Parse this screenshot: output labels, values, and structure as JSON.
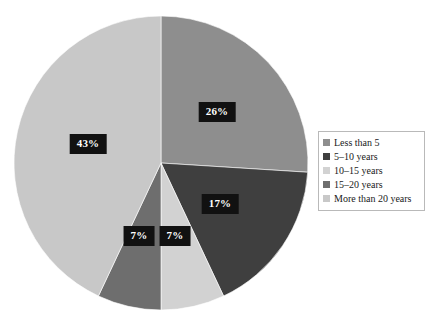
{
  "chart_data": {
    "type": "pie",
    "title": "",
    "subtitle": "",
    "categories": [
      "Less than 5",
      "5–10 years",
      "10–15 years",
      "15–20 years",
      "More than 20 years"
    ],
    "values": [
      26,
      17,
      7,
      7,
      43
    ],
    "value_labels": [
      "26%",
      "17%",
      "7%",
      "7%",
      "43%"
    ],
    "unit": "%",
    "total": 100,
    "start_angle_deg": 0,
    "direction": "clockwise",
    "legend_position": "right",
    "grid": false,
    "slice_colors": [
      "#8e8e8e",
      "#3f3f3f",
      "#d2d2d2",
      "#6e6e6e",
      "#c8c8c8"
    ],
    "label_text_color": "#ffffff",
    "label_box_color": "#111111",
    "background_color": "#ffffff",
    "slices": [
      {
        "label": "Less than 5",
        "value": 26,
        "value_label": "26%",
        "color": "#8e8e8e",
        "start_deg": 0,
        "end_deg": 93.6,
        "label_x": 217,
        "label_y": 112
      },
      {
        "label": "5–10 years",
        "value": 17,
        "value_label": "17%",
        "color": "#3f3f3f",
        "start_deg": 93.6,
        "end_deg": 154.8,
        "label_x": 220,
        "label_y": 204
      },
      {
        "label": "10–15 years",
        "value": 7,
        "value_label": "7%",
        "color": "#d2d2d2",
        "start_deg": 154.8,
        "end_deg": 180.0,
        "label_x": 175,
        "label_y": 236
      },
      {
        "label": "15–20 years",
        "value": 7,
        "value_label": "7%",
        "color": "#6e6e6e",
        "start_deg": 180.0,
        "end_deg": 205.2,
        "label_x": 139,
        "label_y": 236
      },
      {
        "label": "More than 20 years",
        "value": 43,
        "value_label": "43%",
        "color": "#c8c8c8",
        "start_deg": 205.2,
        "end_deg": 360.0,
        "label_x": 88,
        "label_y": 144
      }
    ],
    "geometry": {
      "center_x": 161,
      "center_y": 163,
      "radius": 147
    }
  },
  "legend": {
    "items": [
      {
        "label": "Less than 5",
        "color": "#8e8e8e"
      },
      {
        "label": "5–10 years",
        "color": "#3f3f3f"
      },
      {
        "label": "10–15 years",
        "color": "#d2d2d2"
      },
      {
        "label": "15–20 years",
        "color": "#6e6e6e"
      },
      {
        "label": "More than 20 years",
        "color": "#c8c8c8"
      }
    ]
  }
}
